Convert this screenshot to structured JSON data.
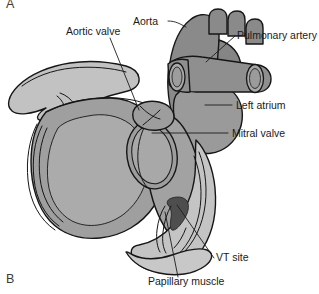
{
  "figure": {
    "panel_letter_top": "A",
    "panel_letter_bottom": "B"
  },
  "labels": [
    {
      "id": "aortic-valve",
      "text": "Aortic valve",
      "x": 66,
      "y": 35,
      "anchor": "start"
    },
    {
      "id": "aorta",
      "text": "Aorta",
      "x": 133,
      "y": 25,
      "anchor": "start"
    },
    {
      "id": "pulmonary-artery",
      "text": "Pulmonary artery",
      "x": 237,
      "y": 39,
      "anchor": "start"
    },
    {
      "id": "left-atrium",
      "text": "Left atrium",
      "x": 236,
      "y": 109,
      "anchor": "start"
    },
    {
      "id": "mitral-valve",
      "text": "Mitral valve",
      "x": 232,
      "y": 137,
      "anchor": "start"
    },
    {
      "id": "vt-site",
      "text": "VT site",
      "x": 216,
      "y": 261,
      "anchor": "start"
    },
    {
      "id": "papillary-muscle",
      "text": "Papillary muscle",
      "x": 148,
      "y": 285,
      "anchor": "start"
    }
  ],
  "colors": {
    "background": "#ffffff",
    "outline": "#161616",
    "myocardium_mid": "#9a9a9a",
    "myocardium_light": "#b9b9b9",
    "myocardium_pale": "#cfcfcf",
    "great_vessel": "#8a8a8a",
    "vessel_dark": "#7d7d7d",
    "vt_site_dark": "#4e4e4e",
    "endocardium_highlight": "#c7c7c7",
    "label_text": "#1a1a1a"
  }
}
